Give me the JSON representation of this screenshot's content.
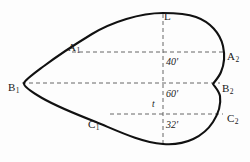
{
  "diagram": {
    "background_color": "#fdfdfd",
    "outline_color": "#111111",
    "guide_color": "#555555",
    "points": {
      "apex": {
        "label": "L",
        "x": 164,
        "y": 11
      },
      "upper_left": {
        "label": "A",
        "sub": "1",
        "x": 68,
        "y": 42
      },
      "upper_right": {
        "label": "A",
        "sub": "2",
        "x": 227,
        "y": 51
      },
      "mid_left": {
        "label": "B",
        "sub": "1",
        "x": 8,
        "y": 82
      },
      "mid_right": {
        "label": "B",
        "sub": "2",
        "x": 222,
        "y": 83
      },
      "lower_left": {
        "label": "C",
        "sub": "1",
        "x": 88,
        "y": 119
      },
      "lower_right": {
        "label": "C",
        "sub": "2",
        "x": 227,
        "y": 113
      }
    },
    "dimensions": [
      {
        "name": "upper-segment",
        "value": "40'",
        "x": 166,
        "y": 57
      },
      {
        "name": "middle-segment",
        "value": "60'",
        "x": 166,
        "y": 89
      },
      {
        "name": "lower-segment",
        "value": "32'",
        "x": 166,
        "y": 120
      },
      {
        "name": "thickness",
        "value": "t",
        "x": 152,
        "y": 100
      }
    ],
    "guides": {
      "horizontal": [
        {
          "name": "a-chord",
          "y": 52,
          "x1": 72,
          "x2": 223
        },
        {
          "name": "b-chord",
          "y": 83,
          "x1": 22,
          "x2": 220
        },
        {
          "name": "c-chord",
          "y": 114,
          "x1": 110,
          "x2": 223
        }
      ],
      "vertical": [
        {
          "name": "center-axis",
          "x": 163,
          "y1": 14,
          "y2": 145
        }
      ]
    },
    "outline_path": "M 163 13 C 140 13 112 22 92 34 C 74 45 56 57 44 66 C 32 75 25 80 24 83 C 23 86 30 91 42 98 C 56 106 78 115 96 122 C 118 131 140 142 163 144 C 186 146 204 136 213 122 C 220 111 221 103 220 96 C 219 91 215 87 213 84 C 215 81 219 77 221 72 C 224 65 225 55 223 46 C 220 33 210 22 196 17 C 185 13 173 13 163 13 Z"
  }
}
